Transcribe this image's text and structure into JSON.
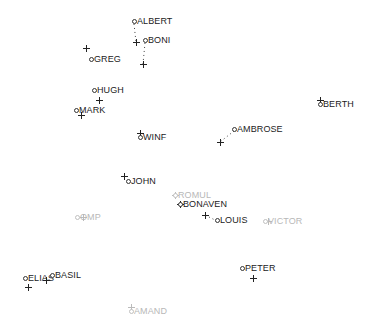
{
  "chart_data": {
    "type": "scatter",
    "title": "",
    "xlabel": "",
    "ylabel": "",
    "grid": false,
    "legend": "none",
    "points": [
      {
        "label": "ALBERT",
        "x": 134,
        "y": 21,
        "cross": {
          "x": 136,
          "y": 42
        },
        "faded": false
      },
      {
        "label": "BONI",
        "x": 145,
        "y": 40,
        "cross": {
          "x": 143,
          "y": 64
        },
        "faded": false
      },
      {
        "label": "GREG",
        "x": 91,
        "y": 59,
        "cross": {
          "x": 86,
          "y": 48
        },
        "faded": false
      },
      {
        "label": "HUGH",
        "x": 94,
        "y": 90,
        "cross": {
          "x": 99,
          "y": 100
        },
        "faded": false
      },
      {
        "label": "MARK",
        "x": 76,
        "y": 110,
        "cross": {
          "x": 81,
          "y": 115
        },
        "faded": false
      },
      {
        "label": "WINF",
        "x": 140,
        "y": 137,
        "cross": {
          "x": 140,
          "y": 133
        },
        "faded": false
      },
      {
        "label": "BERTH",
        "x": 320,
        "y": 104,
        "cross": {
          "x": 320,
          "y": 100
        },
        "faded": false
      },
      {
        "label": "AMBROSE",
        "x": 234,
        "y": 129,
        "cross": {
          "x": 220,
          "y": 142
        },
        "faded": false
      },
      {
        "label": "JOHN",
        "x": 128,
        "y": 181,
        "cross": {
          "x": 124,
          "y": 176
        },
        "faded": false
      },
      {
        "label": "ROMUL",
        "x": 175,
        "y": 195,
        "cross": {
          "x": 175,
          "y": 195
        },
        "faded": true
      },
      {
        "label": "BONAVEN",
        "x": 180,
        "y": 204,
        "cross": {
          "x": 180,
          "y": 204
        },
        "faded": false
      },
      {
        "label": "LOUIS",
        "x": 217,
        "y": 220,
        "cross": {
          "x": 205,
          "y": 215
        },
        "faded": false
      },
      {
        "label": "VICTOR",
        "x": 265,
        "y": 221,
        "cross": {
          "x": 268,
          "y": 221
        },
        "faded": true
      },
      {
        "label": "OMP",
        "x": 77,
        "y": 217,
        "cross": {
          "x": 83,
          "y": 217
        },
        "faded": true
      },
      {
        "label": "ELIAS",
        "x": 25,
        "y": 278,
        "cross": {
          "x": 28,
          "y": 287
        },
        "faded": false
      },
      {
        "label": "BASIL",
        "x": 52,
        "y": 275,
        "cross": {
          "x": 46,
          "y": 280
        },
        "faded": false
      },
      {
        "label": "PETER",
        "x": 242,
        "y": 268,
        "cross": {
          "x": 253,
          "y": 278
        },
        "faded": false
      },
      {
        "label": "AMAND",
        "x": 131,
        "y": 311,
        "cross": {
          "x": 131,
          "y": 307
        },
        "faded": true
      }
    ],
    "connectors": [
      {
        "from": [
          134,
          24
        ],
        "to": [
          136,
          42
        ],
        "style": "dotted"
      },
      {
        "from": [
          145,
          43
        ],
        "to": [
          143,
          64
        ],
        "style": "dotted"
      },
      {
        "from": [
          234,
          131
        ],
        "to": [
          220,
          142
        ],
        "style": "dotted"
      },
      {
        "from": [
          217,
          221
        ],
        "to": [
          205,
          215
        ],
        "style": "dotted"
      }
    ],
    "xlim": [
      0,
      371
    ],
    "ylim": [
      0,
      327
    ]
  }
}
